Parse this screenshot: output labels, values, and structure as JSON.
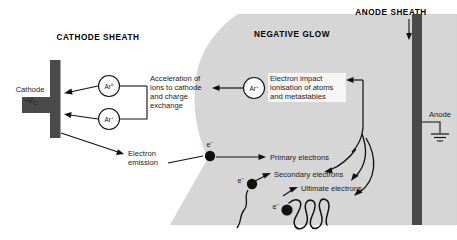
{
  "figure": {
    "background_color": "#ffffff",
    "glow_fill_color": "#d6d6d6",
    "electrode_color": "#4a4a4a",
    "line_color": "#111111"
  },
  "regions": [
    {
      "id": "cathode-sheath",
      "label": "CATHODE SHEATH"
    },
    {
      "id": "negative-glow",
      "label": "NEGATIVE GLOW"
    },
    {
      "id": "anode-sheath",
      "label": "ANODE SHEATH"
    }
  ],
  "electrodes": {
    "cathode": {
      "label": "Cathode",
      "potential": "−V",
      "potential_subscript": "C"
    },
    "anode": {
      "label": "Anode",
      "ground_symbol": "earth-ground"
    }
  },
  "particles": [
    {
      "id": "ar-neutral",
      "symbol": "Ar",
      "charge": "0"
    },
    {
      "id": "ar-ion",
      "symbol": "Ar",
      "charge": "+"
    },
    {
      "id": "ar-ion-glow",
      "symbol": "Ar",
      "charge": "+"
    }
  ],
  "electron_markers": [
    {
      "id": "electron-emission-marker",
      "symbol": "e",
      "charge": "−"
    },
    {
      "id": "electron-secondary-marker",
      "symbol": "e",
      "charge": "−"
    },
    {
      "id": "electron-ultimate-marker",
      "symbol": "e",
      "charge": "−"
    }
  ],
  "annotations": [
    {
      "id": "acceleration-note",
      "lines": [
        "Acceleration of",
        "ions to cathode",
        "and charge",
        "exchange"
      ]
    },
    {
      "id": "ionisation-note",
      "lines": [
        "Electron impact",
        "ionisation of atoms",
        "and metastables"
      ]
    },
    {
      "id": "electron-emission-note",
      "lines": [
        "Electron",
        "emission"
      ]
    },
    {
      "id": "primary-electrons-note",
      "lines": [
        "Primary electrons"
      ]
    },
    {
      "id": "secondary-electrons-note",
      "lines": [
        "Secondary electrons"
      ]
    },
    {
      "id": "ultimate-electrons-note",
      "lines": [
        "Ultimate electrons"
      ]
    }
  ]
}
